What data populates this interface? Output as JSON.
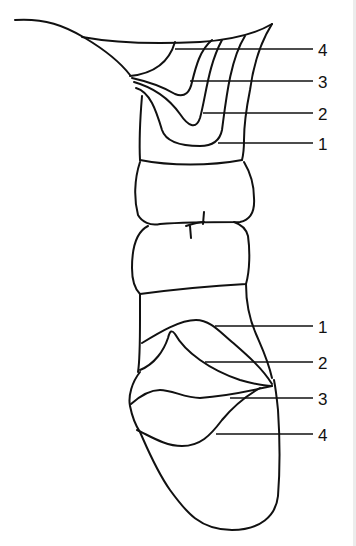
{
  "figure": {
    "type": "anatomical line drawing",
    "line_color": "#111111",
    "background": "#ffffff"
  },
  "labels": {
    "top": [
      {
        "id": "top-4",
        "text": "4"
      },
      {
        "id": "top-3",
        "text": "3"
      },
      {
        "id": "top-2",
        "text": "2"
      },
      {
        "id": "top-1",
        "text": "1"
      }
    ],
    "bottom": [
      {
        "id": "bottom-1",
        "text": "1"
      },
      {
        "id": "bottom-2",
        "text": "2"
      },
      {
        "id": "bottom-3",
        "text": "3"
      },
      {
        "id": "bottom-4",
        "text": "4"
      }
    ]
  }
}
